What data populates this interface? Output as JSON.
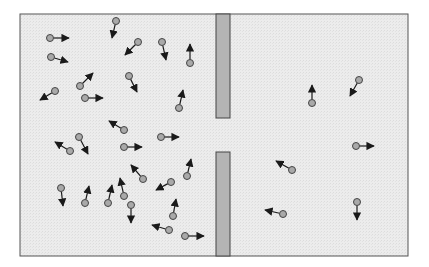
{
  "diagram": {
    "colors": {
      "background": "#ffffff",
      "container_fill": "#ececec",
      "container_stroke": "#555555",
      "wall_fill": "#b4b4b4",
      "wall_stroke": "#444444",
      "particle_fill": "#a9a9a9",
      "particle_stroke": "#444444",
      "arrow": "#1a1a1a"
    },
    "container": {
      "x": 20,
      "y": 14,
      "width": 388,
      "height": 242
    },
    "wall": {
      "x": 216,
      "width": 14,
      "top_segment": {
        "y": 14,
        "height": 104
      },
      "bottom_segment": {
        "y": 152,
        "height": 104
      },
      "opening": {
        "y": 118,
        "height": 34
      }
    },
    "particle_radius": 3.5,
    "particles_left": [
      {
        "x": 50,
        "y": 38,
        "ax": 69,
        "ay": 38
      },
      {
        "x": 51,
        "y": 57,
        "ax": 68,
        "ay": 62
      },
      {
        "x": 116,
        "y": 21,
        "ax": 112,
        "ay": 38
      },
      {
        "x": 138,
        "y": 42,
        "ax": 125,
        "ay": 55
      },
      {
        "x": 162,
        "y": 42,
        "ax": 166,
        "ay": 60
      },
      {
        "x": 190,
        "y": 63,
        "ax": 190,
        "ay": 44
      },
      {
        "x": 129,
        "y": 76,
        "ax": 137,
        "ay": 92
      },
      {
        "x": 80,
        "y": 86,
        "ax": 93,
        "ay": 73
      },
      {
        "x": 55,
        "y": 91,
        "ax": 40,
        "ay": 100
      },
      {
        "x": 85,
        "y": 98,
        "ax": 103,
        "ay": 98
      },
      {
        "x": 179,
        "y": 108,
        "ax": 183,
        "ay": 90
      },
      {
        "x": 124,
        "y": 130,
        "ax": 109,
        "ay": 121
      },
      {
        "x": 79,
        "y": 137,
        "ax": 88,
        "ay": 154
      },
      {
        "x": 161,
        "y": 137,
        "ax": 179,
        "ay": 137
      },
      {
        "x": 124,
        "y": 147,
        "ax": 142,
        "ay": 147
      },
      {
        "x": 70,
        "y": 151,
        "ax": 55,
        "ay": 142
      },
      {
        "x": 187,
        "y": 176,
        "ax": 191,
        "ay": 159
      },
      {
        "x": 143,
        "y": 179,
        "ax": 131,
        "ay": 165
      },
      {
        "x": 171,
        "y": 182,
        "ax": 156,
        "ay": 190
      },
      {
        "x": 61,
        "y": 188,
        "ax": 63,
        "ay": 206
      },
      {
        "x": 124,
        "y": 196,
        "ax": 120,
        "ay": 178
      },
      {
        "x": 85,
        "y": 203,
        "ax": 89,
        "ay": 186
      },
      {
        "x": 108,
        "y": 203,
        "ax": 112,
        "ay": 185
      },
      {
        "x": 131,
        "y": 205,
        "ax": 131,
        "ay": 223
      },
      {
        "x": 173,
        "y": 216,
        "ax": 176,
        "ay": 199
      },
      {
        "x": 169,
        "y": 230,
        "ax": 152,
        "ay": 225
      },
      {
        "x": 185,
        "y": 236,
        "ax": 204,
        "ay": 236
      }
    ],
    "particles_right": [
      {
        "x": 359,
        "y": 80,
        "ax": 350,
        "ay": 96
      },
      {
        "x": 312,
        "y": 103,
        "ax": 312,
        "ay": 85
      },
      {
        "x": 356,
        "y": 146,
        "ax": 374,
        "ay": 146
      },
      {
        "x": 292,
        "y": 170,
        "ax": 276,
        "ay": 161
      },
      {
        "x": 357,
        "y": 202,
        "ax": 357,
        "ay": 220
      },
      {
        "x": 283,
        "y": 214,
        "ax": 265,
        "ay": 210
      }
    ],
    "counts": {
      "left": 27,
      "right": 6
    }
  }
}
